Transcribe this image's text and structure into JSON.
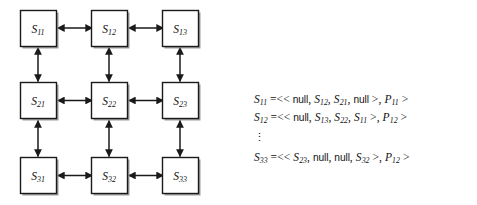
{
  "figure": {
    "caption": "",
    "diagram": {
      "type": "grid-mesh",
      "rows": 3,
      "cols": 3,
      "edge_style": "double-headed-arrow",
      "node_fill": "#ffffff",
      "node_stroke": "#1a1a1a",
      "shadow_color": "#8c8c8c",
      "nodes": [
        {
          "id": "S11",
          "base": "S",
          "sub": "11",
          "row": 0,
          "col": 0
        },
        {
          "id": "S12",
          "base": "S",
          "sub": "12",
          "row": 0,
          "col": 1
        },
        {
          "id": "S13",
          "base": "S",
          "sub": "13",
          "row": 0,
          "col": 2
        },
        {
          "id": "S21",
          "base": "S",
          "sub": "21",
          "row": 1,
          "col": 0
        },
        {
          "id": "S22",
          "base": "S",
          "sub": "22",
          "row": 1,
          "col": 1
        },
        {
          "id": "S23",
          "base": "S",
          "sub": "23",
          "row": 1,
          "col": 2
        },
        {
          "id": "S31",
          "base": "S",
          "sub": "31",
          "row": 2,
          "col": 0
        },
        {
          "id": "S32",
          "base": "S",
          "sub": "32",
          "row": 2,
          "col": 1
        },
        {
          "id": "S33",
          "base": "S",
          "sub": "33",
          "row": 2,
          "col": 2
        }
      ],
      "edges": [
        {
          "from": "S11",
          "to": "S12",
          "orientation": "horizontal"
        },
        {
          "from": "S12",
          "to": "S13",
          "orientation": "horizontal"
        },
        {
          "from": "S21",
          "to": "S22",
          "orientation": "horizontal"
        },
        {
          "from": "S22",
          "to": "S23",
          "orientation": "horizontal"
        },
        {
          "from": "S31",
          "to": "S32",
          "orientation": "horizontal"
        },
        {
          "from": "S32",
          "to": "S33",
          "orientation": "horizontal"
        },
        {
          "from": "S11",
          "to": "S21",
          "orientation": "vertical"
        },
        {
          "from": "S12",
          "to": "S22",
          "orientation": "vertical"
        },
        {
          "from": "S13",
          "to": "S23",
          "orientation": "vertical"
        },
        {
          "from": "S21",
          "to": "S31",
          "orientation": "vertical"
        },
        {
          "from": "S22",
          "to": "S32",
          "orientation": "vertical"
        },
        {
          "from": "S23",
          "to": "S33",
          "orientation": "vertical"
        }
      ]
    },
    "equations": {
      "ellipsis_glyph": "⋮",
      "lines": [
        {
          "kind": "equation",
          "lhs": {
            "base": "S",
            "sub": "11"
          },
          "relation": "=<<",
          "neighbors": [
            {
              "type": "null",
              "text": "null"
            },
            {
              "type": "symbol",
              "base": "S",
              "sub": "12"
            },
            {
              "type": "symbol",
              "base": "S",
              "sub": "21"
            },
            {
              "type": "null",
              "text": "null"
            }
          ],
          "close_inner": ">",
          "payload": {
            "base": "P",
            "sub": "11"
          },
          "close_outer": ">",
          "plain": "S11 =<< null, S12, S21, null >, P11 >"
        },
        {
          "kind": "equation",
          "lhs": {
            "base": "S",
            "sub": "12"
          },
          "relation": "=<<",
          "neighbors": [
            {
              "type": "null",
              "text": "null"
            },
            {
              "type": "symbol",
              "base": "S",
              "sub": "13"
            },
            {
              "type": "symbol",
              "base": "S",
              "sub": "22"
            },
            {
              "type": "symbol",
              "base": "S",
              "sub": "11"
            }
          ],
          "close_inner": ">",
          "payload": {
            "base": "P",
            "sub": "12"
          },
          "close_outer": ">",
          "plain": "S12 =<< null, S13, S22, S11 >, P12 >"
        },
        {
          "kind": "ellipsis"
        },
        {
          "kind": "equation",
          "lhs": {
            "base": "S",
            "sub": "33"
          },
          "relation": "=<<",
          "neighbors": [
            {
              "type": "symbol",
              "base": "S",
              "sub": "23"
            },
            {
              "type": "null",
              "text": "null"
            },
            {
              "type": "null",
              "text": "null"
            },
            {
              "type": "symbol",
              "base": "S",
              "sub": "32"
            }
          ],
          "close_inner": ">",
          "payload": {
            "base": "P",
            "sub": "12"
          },
          "close_outer": ">",
          "plain": "S33 =<< S23, null, null, S32 >, P12 >"
        }
      ]
    }
  }
}
